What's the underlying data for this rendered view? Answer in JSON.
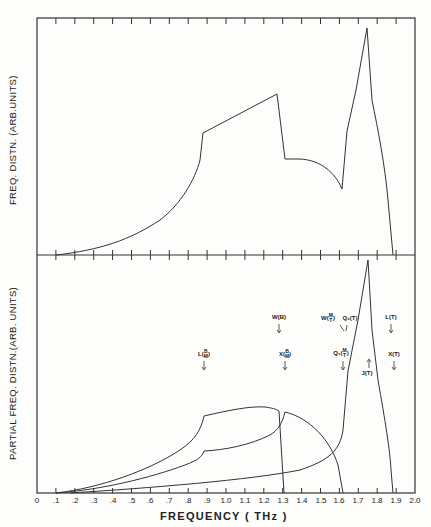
{
  "chart_data": [
    {
      "type": "line",
      "panel": "top",
      "title": "",
      "xlabel": "FREQUENCY ( THz )",
      "ylabel": "FREQ. DISTN. (ARB.UNITS)",
      "xlim": [
        0,
        2.0
      ],
      "ylim": [
        0,
        100
      ],
      "grid": false,
      "series": [
        {
          "name": "total frequency distribution",
          "x": [
            0.1,
            0.2,
            0.3,
            0.4,
            0.5,
            0.6,
            0.7,
            0.8,
            0.85,
            0.88,
            0.9,
            1.27,
            1.29,
            1.31,
            1.45,
            1.55,
            1.62,
            1.64,
            1.7,
            1.75,
            1.78,
            1.84,
            1.87
          ],
          "y": [
            0,
            1.5,
            3.5,
            6.5,
            11,
            17,
            25,
            35,
            43,
            50,
            54,
            71,
            56,
            42,
            41,
            36,
            29,
            55,
            78,
            100,
            65,
            40,
            0
          ]
        }
      ]
    },
    {
      "type": "line",
      "panel": "bottom",
      "xlabel": "FREQUENCY ( THz )",
      "ylabel": "PARTIAL  FREQ. DISTN.(ARB. UNITS)",
      "xlim": [
        0,
        2.0
      ],
      "ylim": [
        0,
        100
      ],
      "grid": false,
      "series": [
        {
          "name": "branch B (upper)",
          "x": [
            0.1,
            0.3,
            0.5,
            0.7,
            0.85,
            0.9,
            1.0,
            1.16,
            1.27,
            1.29,
            1.3
          ],
          "y": [
            0,
            2,
            7,
            16,
            27,
            33,
            35,
            37,
            35,
            20,
            0
          ]
        },
        {
          "name": "branch M (middle)",
          "x": [
            0.1,
            0.3,
            0.5,
            0.7,
            0.85,
            0.9,
            1.1,
            1.27,
            1.31,
            1.4,
            1.5,
            1.58,
            1.62
          ],
          "y": [
            0,
            1.5,
            4.5,
            10,
            16,
            18,
            21,
            28,
            34,
            31,
            24,
            12,
            0
          ]
        },
        {
          "name": "branch T (upper spike)",
          "x": [
            0.2,
            0.6,
            1.0,
            1.3,
            1.5,
            1.6,
            1.63,
            1.64,
            1.7,
            1.75,
            1.8,
            1.85,
            1.87
          ],
          "y": [
            0,
            2,
            5,
            8,
            15,
            22,
            40,
            52,
            75,
            98,
            48,
            20,
            0
          ]
        }
      ],
      "annotations": [
        {
          "label": "L(B/M)",
          "x": 0.88,
          "direction": "down"
        },
        {
          "label": "W(B)",
          "x": 1.27,
          "direction": "down"
        },
        {
          "label": "X(B/M)",
          "x": 1.31,
          "direction": "down"
        },
        {
          "label": "W(M/T)",
          "x": 1.62,
          "direction": "down"
        },
        {
          "label": "Q2(T)",
          "x": 1.63,
          "direction": "down"
        },
        {
          "label": "Q1(M/T)",
          "x": 1.61,
          "direction": "down"
        },
        {
          "label": "J(T)",
          "x": 1.75,
          "direction": "up"
        },
        {
          "label": "L(T)",
          "x": 1.87,
          "direction": "down"
        },
        {
          "label": "X(T)",
          "x": 1.88,
          "direction": "down"
        }
      ]
    }
  ],
  "axes": {
    "x_ticks": [
      "0",
      ".1",
      ".2",
      ".3",
      ".4",
      ".5",
      ".6",
      ".7",
      ".8",
      ".9",
      "1.0",
      "1.1",
      "1.2",
      "1.3",
      "1.4",
      "1.5",
      "1.6",
      "1.7",
      "1.8",
      "1.9",
      "2.0"
    ],
    "xlabel": "FREQUENCY  ( THz )",
    "top_ylabel": "FREQ. DISTN. (ARB.UNITS)",
    "bottom_ylabel": "PARTIAL  FREQ. DISTN.(ARB. UNITS)"
  },
  "annotations": {
    "lb": {
      "main": "L",
      "num": "B",
      "den": "M"
    },
    "wb": "W(B)",
    "xb": {
      "main": "X",
      "num": "B",
      "den": "M"
    },
    "wmt": {
      "main": "W",
      "num": "M",
      "den": "T"
    },
    "q2t": "Q₂(T)",
    "q1": {
      "main": "Q₁",
      "num": "M",
      "den": "T"
    },
    "jt": "J(T)",
    "lt": "L(T)",
    "xt": "X(T)"
  }
}
